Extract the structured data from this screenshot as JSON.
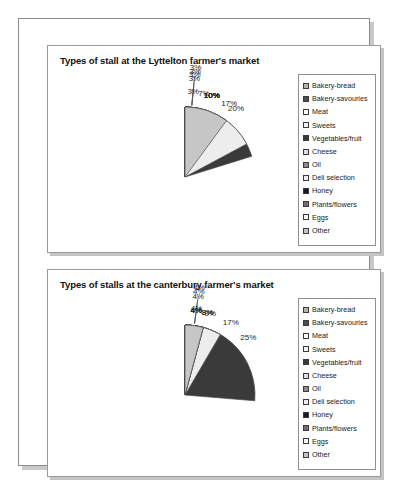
{
  "document": {
    "name": "farmers-market-pie-charts-page"
  },
  "legend_items": [
    {
      "label": "Bakery-bread",
      "color": "#b3b3b3"
    },
    {
      "label": "Bakery-savouries",
      "color": "#4d4d4d"
    },
    {
      "label": "Meat",
      "color": "#fdfdfd"
    },
    {
      "label": "Sweets",
      "color": "#f2f2f2"
    },
    {
      "label": "Vegetables/fruit",
      "color": "#3a3a3a"
    },
    {
      "label": "Cheese",
      "color": "#dcdcdc"
    },
    {
      "label": "Oil",
      "color": "#8c8c8c"
    },
    {
      "label": "Deli selection",
      "color": "#ededed"
    },
    {
      "label": "Honey",
      "color": "#1a1a1a"
    },
    {
      "label": "Plants/flowers",
      "color": "#707070"
    },
    {
      "label": "Eggs",
      "color": "#f7f7f7"
    },
    {
      "label": "Other",
      "color": "#c6c6c6"
    }
  ],
  "chart_data": [
    {
      "type": "pie",
      "title": "Types of stall at the Lyttelton farmer's market",
      "categories": [
        "Bakery-bread",
        "Bakery-savouries",
        "Meat",
        "Sweets",
        "Vegetables/fruit",
        "Cheese",
        "Oil",
        "Deli selection",
        "Honey",
        "Plants/flowers",
        "Eggs",
        "Other"
      ],
      "values": [
        3,
        10,
        10,
        10,
        20,
        7,
        3,
        17,
        3,
        3,
        3,
        10
      ],
      "labels": [
        "3%",
        "10%",
        "10%",
        "10%",
        "20%",
        "7%",
        "3%",
        "17%",
        "3%",
        "3%",
        "3%",
        "10%"
      ],
      "colors": [
        "#b3b3b3",
        "#4d4d4d",
        "#fdfdfd",
        "#f2f2f2",
        "#3a3a3a",
        "#dcdcdc",
        "#8c8c8c",
        "#ededed",
        "#1a1a1a",
        "#707070",
        "#f7f7f7",
        "#c6c6c6"
      ],
      "unit": "%",
      "legend_position": "right",
      "start_angle": -90
    },
    {
      "type": "pie",
      "title": "Types of stalls at the canterbury farmer's market",
      "categories": [
        "Bakery-bread",
        "Bakery-savouries",
        "Meat",
        "Sweets",
        "Vegetables/fruit",
        "Cheese",
        "Oil",
        "Deli selection",
        "Honey",
        "Plants/flowers",
        "Eggs",
        "Other"
      ],
      "values": [
        4,
        4,
        17,
        9,
        25,
        4,
        8,
        8,
        4,
        4,
        4,
        4
      ],
      "labels": [
        "4%",
        "4%",
        "17%",
        "9%",
        "25%",
        "4%",
        "8%",
        "8%",
        "4%",
        "4%",
        "4%",
        "4%"
      ],
      "colors": [
        "#b3b3b3",
        "#4d4d4d",
        "#fdfdfd",
        "#f2f2f2",
        "#3a3a3a",
        "#dcdcdc",
        "#8c8c8c",
        "#ededed",
        "#1a1a1a",
        "#707070",
        "#f7f7f7",
        "#c6c6c6"
      ],
      "unit": "%",
      "legend_position": "right",
      "start_angle": -90
    }
  ]
}
